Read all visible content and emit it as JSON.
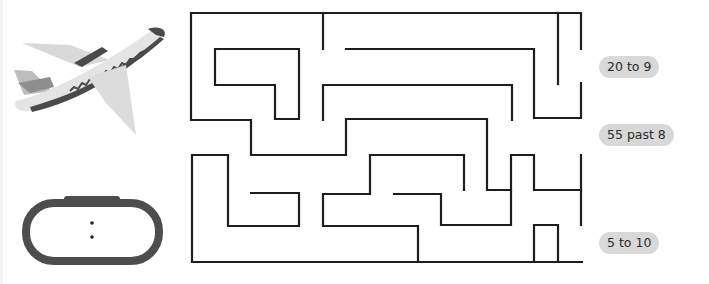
{
  "worksheet": {
    "type": "time maze",
    "images": {
      "plane": "airplane-icon",
      "clock": "digital-clock-icon"
    },
    "clock_display": ":",
    "labels": [
      {
        "text": "20 to 9",
        "top": 56
      },
      {
        "text": "55 past 8",
        "top": 124
      },
      {
        "text": "5 to 10",
        "top": 232
      }
    ],
    "colors": {
      "maze_line": "#1e1e1e",
      "pill_bg": "#d8d8d8",
      "plane_body": "#e2e2e2",
      "plane_stripe": "#4a4a4a",
      "clock_frame": "#4d4d4d"
    }
  }
}
